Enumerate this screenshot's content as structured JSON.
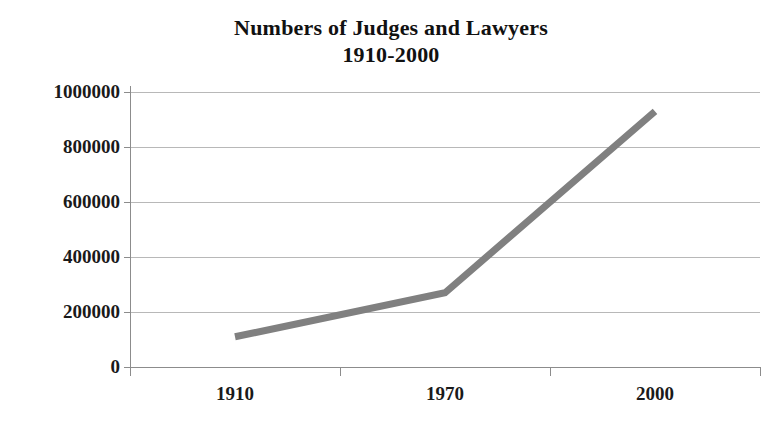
{
  "chart_data": {
    "type": "line",
    "title": "Numbers of Judges and Lawyers 1910-2000",
    "title_line1": "Numbers of Judges and Lawyers",
    "title_line2": "1910-2000",
    "xlabel": "",
    "ylabel": "",
    "categories": [
      "1910",
      "1970",
      "2000"
    ],
    "values": [
      110000,
      270000,
      930000
    ],
    "series": [
      {
        "name": "Judges and Lawyers",
        "values": [
          110000,
          270000,
          930000
        ]
      }
    ],
    "ylim": [
      0,
      1000000
    ],
    "y_ticks": [
      0,
      200000,
      400000,
      600000,
      800000,
      1000000
    ],
    "y_tick_labels": [
      "0",
      "200000",
      "400000",
      "600000",
      "800000",
      "1000000"
    ],
    "x_tick_labels": [
      "1910",
      "1970",
      "2000"
    ],
    "grid": true,
    "grid_axis": "y",
    "legend": false,
    "legend_position": "none",
    "series_color": "#808080",
    "line_width": 7,
    "gridline_color": "#b8b8b8",
    "axis_color": "#8c8c8c",
    "text_color": "#1a1a1a",
    "background_color": "#ffffff"
  }
}
